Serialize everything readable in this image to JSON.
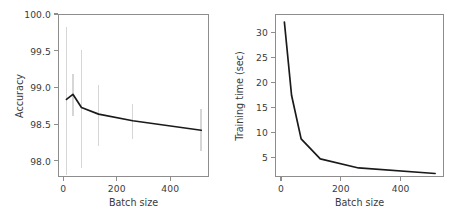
{
  "figure": {
    "panels": [
      "accuracy-panel",
      "training-time-panel"
    ],
    "background_color": "#ffffff",
    "line_color": "#1a1a1a",
    "errorbar_color": "#d6d6d6",
    "axis_color": "#8d8d8d",
    "text_color": "#3b3b3b"
  },
  "chart_data": [
    {
      "type": "line",
      "name": "accuracy-vs-batch-size",
      "title": "",
      "xlabel": "Batch size",
      "ylabel": "Accuracy",
      "x": [
        8,
        32,
        64,
        128,
        256,
        512
      ],
      "values": [
        98.85,
        98.92,
        98.74,
        98.65,
        98.56,
        98.43
      ],
      "error_low": [
        97.82,
        98.62,
        97.92,
        98.21,
        98.31,
        98.15
      ],
      "error_high": [
        99.83,
        99.19,
        99.53,
        99.04,
        98.79,
        98.72
      ],
      "xlim": [
        -20,
        545
      ],
      "ylim": [
        97.78,
        100.0
      ],
      "xticks": [
        0,
        200,
        400
      ],
      "xticklabels": [
        "0",
        "200",
        "400"
      ],
      "yticks": [
        98.0,
        98.5,
        99.0,
        99.5,
        100.0
      ],
      "yticklabels": [
        "98.0",
        "98.5",
        "99.0",
        "99.5",
        "100.0"
      ],
      "grid": false,
      "legend": "none"
    },
    {
      "type": "line",
      "name": "training-time-vs-batch-size",
      "title": "",
      "xlabel": "Batch size",
      "ylabel": "Training time (sec)",
      "x": [
        8,
        32,
        64,
        128,
        256,
        512
      ],
      "values": [
        32.2,
        17.6,
        8.9,
        4.9,
        3.1,
        2.0
      ],
      "xlim": [
        -20,
        545
      ],
      "ylim": [
        1.1,
        33.6
      ],
      "xticks": [
        0,
        200,
        400
      ],
      "xticklabels": [
        "0",
        "200",
        "400"
      ],
      "yticks": [
        5,
        10,
        15,
        20,
        25,
        30
      ],
      "yticklabels": [
        "5",
        "10",
        "15",
        "20",
        "25",
        "30"
      ],
      "grid": false,
      "legend": "none"
    }
  ]
}
